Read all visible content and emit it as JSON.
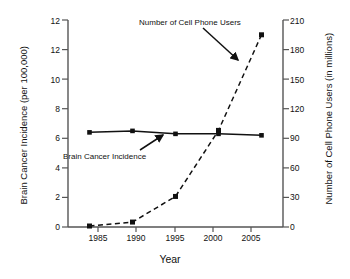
{
  "chart_data": {
    "type": "line",
    "title": "",
    "xlabel": "Year",
    "ylabel_left": "Brain Cancer Incidence (per 100,000)",
    "ylabel_right": "Number of Cell Phone Users (in millions)",
    "x": [
      1985,
      1990,
      1995,
      2000,
      2005
    ],
    "xlim": [
      1982.5,
      2007.5
    ],
    "x_tick_labels": [
      "1985",
      "1990",
      "1995",
      "2000",
      "2005"
    ],
    "ylim_left": [
      0,
      14
    ],
    "y_left_tick_labels": [
      "0",
      "2",
      "4",
      "6",
      "8",
      "10",
      "12",
      "12"
    ],
    "y_left_tick_values": [
      0,
      2,
      4,
      6,
      8,
      10,
      12,
      14
    ],
    "ylim_right": [
      0,
      210
    ],
    "y_right_tick_labels": [
      "0",
      "30",
      "60",
      "90",
      "120",
      "150",
      "180",
      "210"
    ],
    "y_right_tick_values": [
      0,
      30,
      60,
      90,
      120,
      150,
      180,
      210
    ],
    "grid": false,
    "legend": "annotations",
    "series": [
      {
        "name": "Brain Cancer Incidence",
        "axis": "left",
        "linestyle": "solid",
        "marker": "square",
        "color": "#111111",
        "x": [
          1985,
          1990,
          1995,
          2000,
          2005
        ],
        "values": [
          6.4,
          6.5,
          6.3,
          6.3,
          6.2
        ]
      },
      {
        "name": "Number of Cell Phone Users",
        "axis": "right",
        "linestyle": "dashed",
        "marker": "square",
        "color": "#111111",
        "x": [
          1985,
          1990,
          1995,
          2000,
          2005
        ],
        "values": [
          1,
          5,
          31,
          98,
          195
        ]
      }
    ],
    "annotations": [
      {
        "text": "Number of Cell Phone Users",
        "target_series": "Number of Cell Phone Users"
      },
      {
        "text": "Brain Cancer Incidence",
        "target_series": "Brain Cancer Incidence"
      }
    ]
  }
}
